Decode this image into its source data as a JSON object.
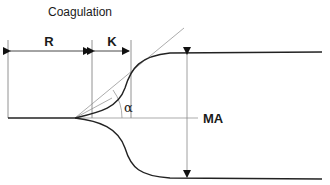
{
  "diagram": {
    "title": "Coagulation",
    "labels": {
      "r": "R",
      "k": "K",
      "alpha": "α",
      "ma": "MA"
    },
    "colors": {
      "curve": "#222222",
      "thin_line": "#777777",
      "arrow": "#111111",
      "text": "#1a1a1a"
    }
  }
}
